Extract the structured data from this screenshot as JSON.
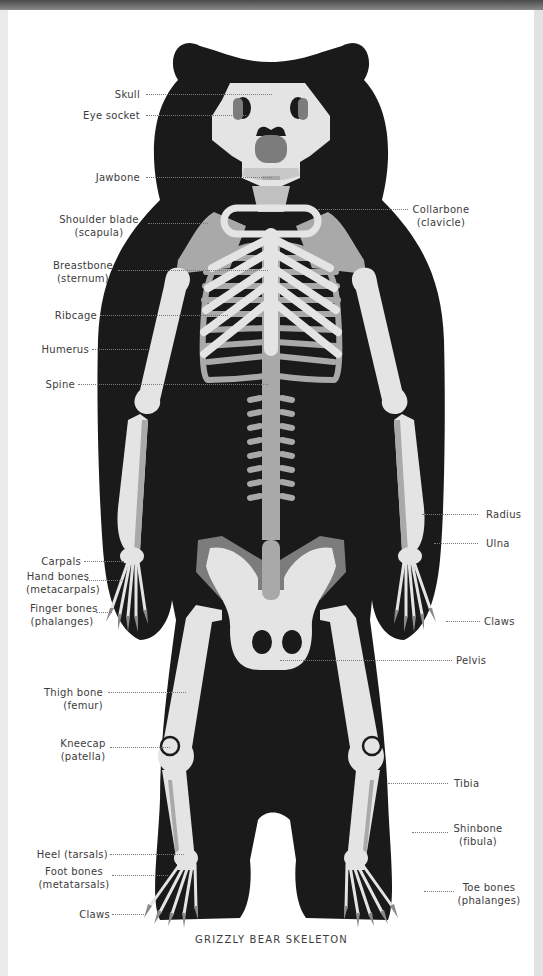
{
  "figure": {
    "title": "GRIZZLY BEAR SKELETON",
    "colors": {
      "silhouette": "#1a1a1a",
      "bone_light": "#e4e4e4",
      "bone_mid": "#a9a9a9",
      "bone_dark": "#7c7c7c",
      "claw": "#8a8a8a",
      "background": "#ffffff"
    }
  },
  "labels": {
    "left": [
      {
        "id": "skull",
        "text": "Skull"
      },
      {
        "id": "eye_socket",
        "text": "Eye socket"
      },
      {
        "id": "jawbone",
        "text": "Jawbone"
      },
      {
        "id": "shoulder_blade",
        "text": "Shoulder blade",
        "sub": "(scapula)"
      },
      {
        "id": "breastbone",
        "text": "Breastbone",
        "sub": "(sternum)"
      },
      {
        "id": "ribcage",
        "text": "Ribcage"
      },
      {
        "id": "humerus",
        "text": "Humerus"
      },
      {
        "id": "spine",
        "text": "Spine"
      },
      {
        "id": "carpals",
        "text": "Carpals"
      },
      {
        "id": "hand_bones",
        "text": "Hand bones",
        "sub": "(metacarpals)"
      },
      {
        "id": "finger_bones",
        "text": "Finger bones",
        "sub": "(phalanges)"
      },
      {
        "id": "thigh_bone",
        "text": "Thigh bone",
        "sub": "(femur)"
      },
      {
        "id": "kneecap",
        "text": "Kneecap",
        "sub": "(patella)"
      },
      {
        "id": "heel",
        "text": "Heel (tarsals)"
      },
      {
        "id": "foot_bones",
        "text": "Foot bones",
        "sub": "(metatarsals)"
      },
      {
        "id": "claws_foot",
        "text": "Claws"
      }
    ],
    "right": [
      {
        "id": "collarbone",
        "text": "Collarbone",
        "sub": "(clavicle)"
      },
      {
        "id": "radius",
        "text": "Radius"
      },
      {
        "id": "ulna",
        "text": "Ulna"
      },
      {
        "id": "claws_hand",
        "text": "Claws"
      },
      {
        "id": "pelvis",
        "text": "Pelvis"
      },
      {
        "id": "tibia",
        "text": "Tibia"
      },
      {
        "id": "shinbone",
        "text": "Shinbone",
        "sub": "(fibula)"
      },
      {
        "id": "toe_bones",
        "text": "Toe bones",
        "sub": "(phalanges)"
      }
    ]
  }
}
